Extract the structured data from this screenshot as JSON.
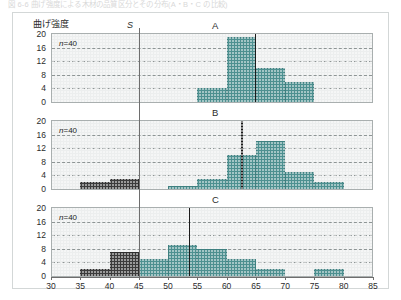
{
  "figure": {
    "caption_top": "図 6-6 曲げ強度による木材の品質区分とその分布(A・B・C の比較)",
    "y_axis_title": "曲げ強度",
    "spec_label": "S",
    "n_label_prefix": "n",
    "n_label_eq": "=",
    "n_label_value": "40"
  },
  "colors": {
    "bar_teal": "#4d9090",
    "bar_dark": "#3b3b3b",
    "panel_bg": "#eceeee",
    "grid": "#6f7878",
    "mean_line": "#1b1b1b",
    "spec_line": "#6e6e6e",
    "frame": "#a9afaf"
  },
  "axes": {
    "x_min": 30,
    "x_max": 85,
    "x_step": 5,
    "x_ticks": [
      "30",
      "35",
      "40",
      "45",
      "50",
      "55",
      "60",
      "65",
      "70",
      "75",
      "80",
      "85"
    ],
    "y_min": 0,
    "y_max": 20,
    "y_step": 4,
    "y_ticks": [
      "20",
      "16",
      "12",
      "8",
      "4",
      "0"
    ],
    "spec_limit": 45,
    "bin_width": 5
  },
  "chart_data": {
    "type": "bar",
    "title": "曲げ強度",
    "xlabel": "",
    "ylabel": "曲げ強度",
    "xlim": [
      30,
      85
    ],
    "ylim": [
      0,
      20
    ],
    "grid": true,
    "legend": null,
    "bin_edges": [
      30,
      35,
      40,
      45,
      50,
      55,
      60,
      65,
      70,
      75,
      80,
      85
    ],
    "panels": [
      {
        "name": "A",
        "letter": "A",
        "n": 40,
        "mean": 64.8,
        "spec_limit": 45,
        "bins": [
          {
            "from": 30,
            "to": 35,
            "value": 0,
            "color": "dark"
          },
          {
            "from": 35,
            "to": 40,
            "value": 0,
            "color": "dark"
          },
          {
            "from": 40,
            "to": 45,
            "value": 0,
            "color": "dark"
          },
          {
            "from": 45,
            "to": 50,
            "value": 0,
            "color": "teal"
          },
          {
            "from": 50,
            "to": 55,
            "value": 0,
            "color": "teal"
          },
          {
            "from": 55,
            "to": 60,
            "value": 4,
            "color": "teal"
          },
          {
            "from": 60,
            "to": 65,
            "value": 19,
            "color": "teal"
          },
          {
            "from": 65,
            "to": 70,
            "value": 10,
            "color": "teal"
          },
          {
            "from": 70,
            "to": 75,
            "value": 6,
            "color": "teal"
          },
          {
            "from": 75,
            "to": 80,
            "value": 0,
            "color": "teal"
          },
          {
            "from": 80,
            "to": 85,
            "value": 0,
            "color": "teal"
          }
        ]
      },
      {
        "name": "B",
        "letter": "B",
        "n": 40,
        "mean": 62.5,
        "spec_limit": 45,
        "bins": [
          {
            "from": 30,
            "to": 35,
            "value": 0,
            "color": "dark"
          },
          {
            "from": 35,
            "to": 40,
            "value": 2,
            "color": "dark"
          },
          {
            "from": 40,
            "to": 45,
            "value": 3,
            "color": "dark"
          },
          {
            "from": 45,
            "to": 50,
            "value": 0,
            "color": "teal"
          },
          {
            "from": 50,
            "to": 55,
            "value": 1,
            "color": "teal"
          },
          {
            "from": 55,
            "to": 60,
            "value": 3,
            "color": "teal"
          },
          {
            "from": 60,
            "to": 65,
            "value": 10,
            "color": "teal"
          },
          {
            "from": 65,
            "to": 70,
            "value": 14,
            "color": "teal"
          },
          {
            "from": 70,
            "to": 75,
            "value": 5,
            "color": "teal"
          },
          {
            "from": 75,
            "to": 80,
            "value": 2,
            "color": "teal"
          },
          {
            "from": 80,
            "to": 85,
            "value": 0,
            "color": "teal"
          }
        ]
      },
      {
        "name": "C",
        "letter": "C",
        "n": 40,
        "mean": 53.5,
        "spec_limit": 45,
        "bins": [
          {
            "from": 30,
            "to": 35,
            "value": 0,
            "color": "dark"
          },
          {
            "from": 35,
            "to": 40,
            "value": 2,
            "color": "dark"
          },
          {
            "from": 40,
            "to": 45,
            "value": 7,
            "color": "dark"
          },
          {
            "from": 45,
            "to": 50,
            "value": 5,
            "color": "teal"
          },
          {
            "from": 50,
            "to": 55,
            "value": 9,
            "color": "teal"
          },
          {
            "from": 55,
            "to": 60,
            "value": 8,
            "color": "teal"
          },
          {
            "from": 60,
            "to": 65,
            "value": 5,
            "color": "teal"
          },
          {
            "from": 65,
            "to": 70,
            "value": 2,
            "color": "teal"
          },
          {
            "from": 70,
            "to": 75,
            "value": 0,
            "color": "teal"
          },
          {
            "from": 75,
            "to": 80,
            "value": 2,
            "color": "teal"
          },
          {
            "from": 80,
            "to": 85,
            "value": 0,
            "color": "teal"
          }
        ]
      }
    ]
  }
}
